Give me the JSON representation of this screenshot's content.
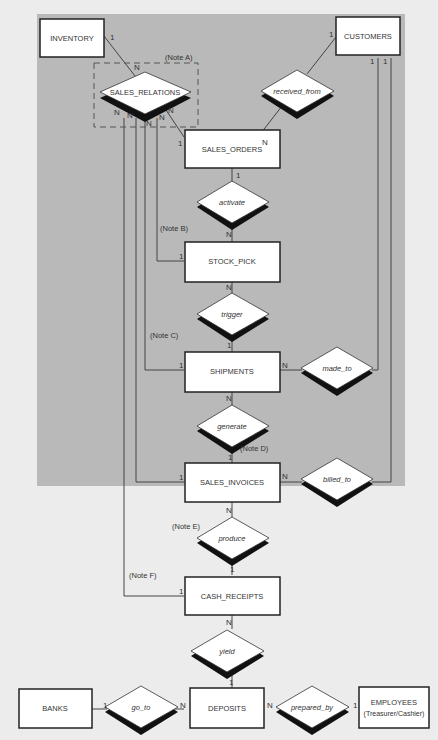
{
  "diagram": {
    "type": "entity-relationship",
    "colors": {
      "shaded_region": "#b9b9b9",
      "background": "#ececec",
      "entity_fill": "#ffffff",
      "line": "#444444"
    },
    "entities": [
      {
        "id": "inventory",
        "label": "INVENTORY"
      },
      {
        "id": "customers",
        "label": "CUSTOMERS"
      },
      {
        "id": "sales_orders",
        "label": "SALES_ORDERS"
      },
      {
        "id": "stock_pick",
        "label": "STOCK_PICK"
      },
      {
        "id": "shipments",
        "label": "SHIPMENTS"
      },
      {
        "id": "sales_invoices",
        "label": "SALES_INVOICES"
      },
      {
        "id": "cash_receipts",
        "label": "CASH_RECEIPTS"
      },
      {
        "id": "deposits",
        "label": "DEPOSITS"
      },
      {
        "id": "banks",
        "label": "BANKS"
      },
      {
        "id": "employees",
        "label": "EMPLOYEES",
        "sublabel": "(Treasurer/Cashier)"
      }
    ],
    "relationships": [
      {
        "id": "sales_relations",
        "label": "SALES_RELATIONS"
      },
      {
        "id": "received_from",
        "label": "received_from"
      },
      {
        "id": "activate",
        "label": "activate"
      },
      {
        "id": "trigger",
        "label": "trigger"
      },
      {
        "id": "made_to",
        "label": "made_to"
      },
      {
        "id": "generate",
        "label": "generate"
      },
      {
        "id": "billed_to",
        "label": "billed_to"
      },
      {
        "id": "produce",
        "label": "produce"
      },
      {
        "id": "yield",
        "label": "yield"
      },
      {
        "id": "go_to",
        "label": "go_to"
      },
      {
        "id": "prepared_by",
        "label": "prepared_by"
      }
    ],
    "notes": {
      "a": "(Note A)",
      "b": "(Note B)",
      "c": "(Note C)",
      "d": "(Note D)",
      "e": "(Note E)",
      "f": "(Note F)"
    },
    "cardinality": {
      "one": "1",
      "many": "N"
    }
  }
}
